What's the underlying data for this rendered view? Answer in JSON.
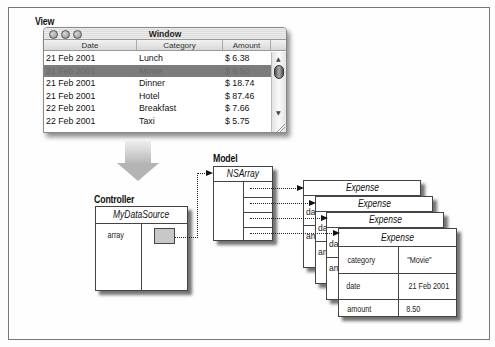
{
  "labels": {
    "view": "View",
    "controller": "Controller",
    "model": "Model"
  },
  "window": {
    "title": "Window",
    "columns": [
      "Date",
      "Category",
      "Amount"
    ],
    "rows": [
      {
        "date": "21 Feb 2001",
        "category": "Lunch",
        "amount": "$ 6.38",
        "selected": false
      },
      {
        "date": "21 Feb 2001",
        "category": "Movie",
        "amount": "$ 8.50",
        "selected": true
      },
      {
        "date": "21 Feb 2001",
        "category": "Dinner",
        "amount": "$ 18.74",
        "selected": false
      },
      {
        "date": "21 Feb 2001",
        "category": "Hotel",
        "amount": "$ 87.46",
        "selected": false
      },
      {
        "date": "22 Feb 2001",
        "category": "Breakfast",
        "amount": "$ 7.66",
        "selected": false
      },
      {
        "date": "22 Feb 2001",
        "category": "Taxi",
        "amount": "$ 5.75",
        "selected": false
      }
    ],
    "scroll_up": "▲",
    "scroll_down": "▼"
  },
  "controller_box": {
    "title": "MyDataSource",
    "field": "array"
  },
  "model_box": {
    "title": "NSArray"
  },
  "expense_cards": {
    "title": "Expense",
    "front": {
      "rows": [
        {
          "key": "category",
          "value": "\"Movie\""
        },
        {
          "key": "date",
          "value": "21 Feb 2001"
        },
        {
          "key": "amount",
          "value": "8.50"
        }
      ]
    },
    "peek_fragments": {
      "category": "ca",
      "date": "da",
      "amount": "am"
    }
  }
}
